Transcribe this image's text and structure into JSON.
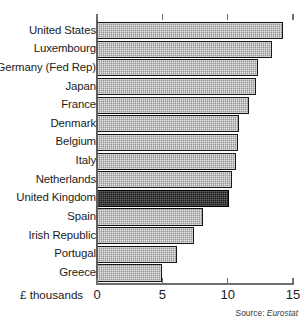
{
  "chart_data": {
    "type": "bar",
    "orientation": "horizontal",
    "title": "",
    "subtitle": "",
    "xlabel": "£ thousands",
    "ylabel": "",
    "xlim": [
      0,
      15
    ],
    "xticks": [
      0,
      5,
      10,
      15
    ],
    "xtick_labels": [
      "0",
      "5",
      "10",
      "15"
    ],
    "grid": false,
    "legend": null,
    "highlight_category": "United Kingdom",
    "categories": [
      "United States",
      "Luxembourg",
      "Germany (Fed Rep)",
      "Japan",
      "France",
      "Denmark",
      "Belgium",
      "Italy",
      "Netherlands",
      "United Kingdom",
      "Spain",
      "Irish Republic",
      "Portugal",
      "Greece"
    ],
    "values": [
      14.2,
      13.4,
      12.3,
      12.2,
      11.6,
      10.9,
      10.8,
      10.6,
      10.3,
      10.1,
      8.1,
      7.4,
      6.1,
      5.0
    ],
    "bars": [
      {
        "label": "United States",
        "value": 14.2,
        "highlight": false
      },
      {
        "label": "Luxembourg",
        "value": 13.4,
        "highlight": false
      },
      {
        "label": "Germany (Fed Rep)",
        "value": 12.3,
        "highlight": false
      },
      {
        "label": "Japan",
        "value": 12.2,
        "highlight": false
      },
      {
        "label": "France",
        "value": 11.6,
        "highlight": false
      },
      {
        "label": "Denmark",
        "value": 10.9,
        "highlight": false
      },
      {
        "label": "Belgium",
        "value": 10.8,
        "highlight": false
      },
      {
        "label": "Italy",
        "value": 10.6,
        "highlight": false
      },
      {
        "label": "Netherlands",
        "value": 10.3,
        "highlight": false
      },
      {
        "label": "United Kingdom",
        "value": 10.1,
        "highlight": true
      },
      {
        "label": "Spain",
        "value": 8.1,
        "highlight": false
      },
      {
        "label": "Irish Republic",
        "value": 7.4,
        "highlight": false
      },
      {
        "label": "Portugal",
        "value": 6.1,
        "highlight": false
      },
      {
        "label": "Greece",
        "value": 5.0,
        "highlight": false
      }
    ],
    "colors": {
      "bar_fill": "#a9a9a9",
      "bar_highlight_fill": "#262626",
      "bar_border": "#15181a",
      "axis": "#6f6f6f",
      "text": "#1b1b1b",
      "background": "#ffffff"
    }
  },
  "source": {
    "prefix": "Source:",
    "value": "Eurostat"
  }
}
